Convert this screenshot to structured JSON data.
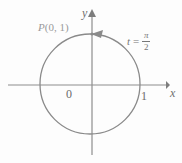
{
  "figure": {
    "background_color": "#fdfdfd",
    "stroke_color": "#8a8a8a",
    "label_color": "#7d7d7d",
    "point_label_color": "#9a9a9a"
  },
  "axes": {
    "x_label": "x",
    "y_label": "y",
    "origin_label": "0",
    "x_tick_label": "1",
    "x_axis_y": 85,
    "y_axis_x": 92,
    "x_start": 8,
    "x_end": 168,
    "y_start": 13,
    "y_end": 155
  },
  "circle": {
    "center_x": 90,
    "center_y": 84,
    "radius": 50,
    "radius_value": 1
  },
  "annotations": {
    "point": {
      "name": "P",
      "coordinates": "(0, 1)",
      "full": "P(0, 1)"
    },
    "parameter": {
      "variable": "t",
      "equals": "=",
      "numerator": "π",
      "denominator": "2",
      "value": "t = π/2"
    },
    "direction_arrow": "counterclockwise-arrowhead"
  }
}
